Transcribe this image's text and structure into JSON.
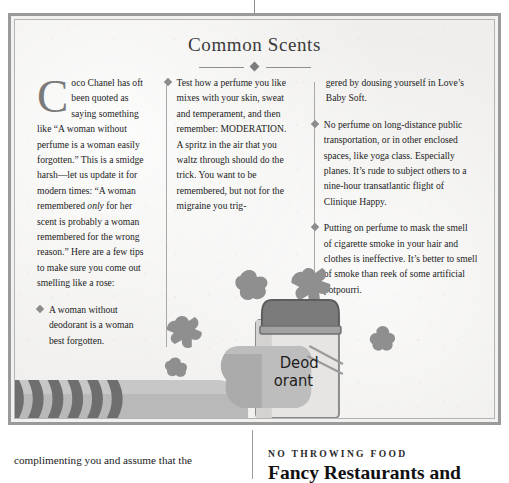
{
  "sidebar": {
    "title": "Common Scents",
    "ornament": "diamond-rule",
    "columns": {
      "col1": {
        "dropcap": "C",
        "body": "oco Chanel has oft been quoted as saying something like “A woman without perfume is a woman easily forgotten.” This is a smidge harsh—let us update it for modern times: “A woman remembered ",
        "body_italic": "only",
        "body_after": " for her scent is probably a woman remembered for the wrong reason.” Here are a few tips to make sure you come out smelling like a rose:",
        "bullet1": "A woman without deodorant is a woman best forgotten."
      },
      "col2": {
        "bullet1": "Test how a perfume you like mixes with your skin, sweat and temperament, and then remember: MODERATION. A spritz in the air that you waltz through should do the trick. You want to be remembered, but not for the migraine you trig-"
      },
      "col3": {
        "continuation": "gered by dousing yourself in Love’s Baby Soft.",
        "bullet1": "No perfume on long-distance public transportation, or in other enclosed spaces, like yoga class. Especially planes. It’s rude to subject others to a nine-hour transatlantic flight of Clinique Happy.",
        "bullet2": "Putting on perfume to mask the smell of cigarette smoke in your hair and clothes is ineffective. It’s better to smell of smoke than reek of some artificial potpourri."
      }
    },
    "illustration": {
      "name": "hand-holding-deodorant",
      "label_line1": "Deod",
      "label_line2": "orant",
      "description": "striped-sleeve-arm-hand-holding-deodorant-stick-with-stink-clouds"
    }
  },
  "page_bottom": {
    "left_column_text": "complimenting you and assume that the",
    "right_column": {
      "kicker": "NO THROWING FOOD",
      "headline": "Fancy Restaurants and"
    }
  },
  "colors": {
    "paper": "#efeeec",
    "border_outer": "#9a9a9a",
    "border_inner": "#b4b4b4",
    "rule": "#a8a8a8",
    "dropcap": "#7a7a7a",
    "bullet": "#8c8c8c",
    "ink": "#1c1c1c",
    "illustration_mid": "#9d9d9d",
    "illustration_dark": "#6f6f6f",
    "illustration_light": "#c9c9c9"
  }
}
